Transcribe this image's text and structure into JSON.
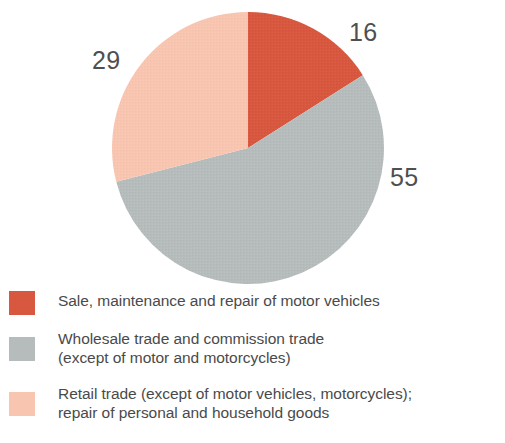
{
  "chart_data": {
    "type": "pie",
    "title": "",
    "categories": [
      "Sale, maintenance and repair of motor vehicles",
      "Wholesale trade and commission trade\n(except of motor and motorcycles)",
      "Retail trade (except of motor vehicles, motorcycles);\nrepair of personal and household goods"
    ],
    "values": [
      16,
      55,
      29
    ],
    "value_labels": [
      "16",
      "55",
      "29"
    ],
    "colors": [
      "#d8573f",
      "#b6bcbc",
      "#f8c5b1"
    ],
    "start_angle_deg": 0,
    "direction": "clockwise",
    "legend_position": "bottom",
    "grid": false
  },
  "labels": {
    "slice_red": "16",
    "slice_gray": "55",
    "slice_peach": "29"
  },
  "legend": {
    "items": [
      {
        "label": "Sale, maintenance and repair of motor vehicles",
        "color": "#d8573f"
      },
      {
        "label": "Wholesale trade and commission trade\n(except of motor and motorcycles)",
        "color": "#b6bcbc"
      },
      {
        "label": "Retail trade (except of motor vehicles, motorcycles);\nrepair of personal and household goods",
        "color": "#f8c5b1"
      }
    ]
  }
}
